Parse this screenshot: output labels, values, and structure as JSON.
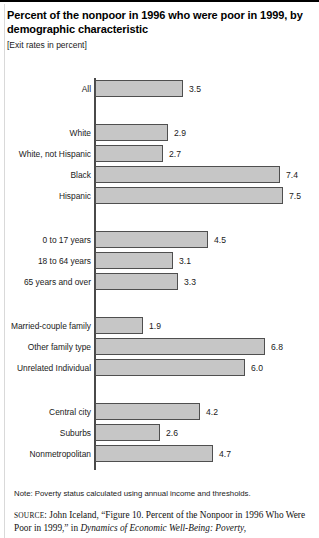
{
  "figure": {
    "title": "Percent of the nonpoor in 1996 who were poor in 1999, by demographic characteristic",
    "subtitle": "[Exit rates in percent]",
    "note": "Note: Poverty status calculated using annual income and thresholds.",
    "source_label": "SOURCE",
    "source_text_1": ": John Iceland, “Figure 10. Percent of the Nonpoor in 1996 Who Were Poor in 1999,” in ",
    "source_title_italic": "Dynamics of Economic Well-Being: Poverty,",
    "bar_fill_color": "#c6c6c6",
    "bar_border_color": "#4f4f4f",
    "axis_color": "#4a4a4a"
  },
  "chart_data": {
    "type": "bar",
    "orientation": "horizontal",
    "title": "Percent of the nonpoor in 1996 who were poor in 1999, by demographic characteristic",
    "subtitle": "[Exit rates in percent]",
    "xlabel": "",
    "ylabel": "",
    "xlim": [
      0,
      7.5
    ],
    "grid": false,
    "legend": "none",
    "value_suffix": "",
    "categories": [
      "All",
      "White",
      "White, not Hispanic",
      "Black",
      "Hispanic",
      "0 to 17 years",
      "18 to 64 years",
      "65 years and over",
      "Married-couple family",
      "Other family type",
      "Unrelated Individual",
      "Central city",
      "Suburbs",
      "Nonmetropolitan"
    ],
    "values": [
      3.5,
      2.9,
      2.7,
      7.4,
      7.5,
      4.5,
      3.1,
      3.3,
      1.9,
      6.8,
      6.0,
      4.2,
      2.6,
      4.7
    ],
    "labels": [
      "3.5",
      "2.9",
      "2.7",
      "7.4",
      "7.5",
      "4.5",
      "3.1",
      "3.3",
      "1.9",
      "6.8",
      "6.0",
      "4.2",
      "2.6",
      "4.7"
    ],
    "groups": [
      {
        "name": "total",
        "categories": [
          "All"
        ]
      },
      {
        "name": "race-ethnicity",
        "categories": [
          "White",
          "White, not Hispanic",
          "Black",
          "Hispanic"
        ]
      },
      {
        "name": "age",
        "categories": [
          "0 to 17 years",
          "18 to 64 years",
          "65 years and over"
        ]
      },
      {
        "name": "family-type",
        "categories": [
          "Married-couple family",
          "Other family type",
          "Unrelated Individual"
        ]
      },
      {
        "name": "residence",
        "categories": [
          "Central city",
          "Suburbs",
          "Nonmetropolitan"
        ]
      }
    ],
    "rows": [
      {
        "label": "All",
        "value": 3.5,
        "text": "3.5",
        "top": 4,
        "group": 0
      },
      {
        "label": "White",
        "value": 2.9,
        "text": "2.9",
        "top": 48,
        "group": 1
      },
      {
        "label": "White, not Hispanic",
        "value": 2.7,
        "text": "2.7",
        "top": 69,
        "group": 1
      },
      {
        "label": "Black",
        "value": 7.4,
        "text": "7.4",
        "top": 90,
        "group": 1
      },
      {
        "label": "Hispanic",
        "value": 7.5,
        "text": "7.5",
        "top": 111,
        "group": 1
      },
      {
        "label": "0 to 17 years",
        "value": 4.5,
        "text": "4.5",
        "top": 155,
        "group": 2
      },
      {
        "label": "18 to 64 years",
        "value": 3.1,
        "text": "3.1",
        "top": 176,
        "group": 2
      },
      {
        "label": "65 years and over",
        "value": 3.3,
        "text": "3.3",
        "top": 197,
        "group": 2
      },
      {
        "label": "Married-couple family",
        "value": 1.9,
        "text": "1.9",
        "top": 241,
        "group": 3
      },
      {
        "label": "Other family type",
        "value": 6.8,
        "text": "6.8",
        "top": 262,
        "group": 3
      },
      {
        "label": "Unrelated Individual",
        "value": 6.0,
        "text": "6.0",
        "top": 283,
        "group": 3
      },
      {
        "label": "Central city",
        "value": 4.2,
        "text": "4.2",
        "top": 327,
        "group": 4
      },
      {
        "label": "Suburbs",
        "value": 2.6,
        "text": "2.6",
        "top": 348,
        "group": 4
      },
      {
        "label": "Nonmetropolitan",
        "value": 4.7,
        "text": "4.7",
        "top": 369,
        "group": 4
      }
    ]
  }
}
